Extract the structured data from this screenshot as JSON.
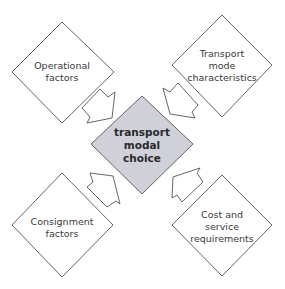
{
  "diagram": {
    "center": {
      "lines": [
        "transport",
        "modal",
        "choice"
      ],
      "fill": "#cfd0d8"
    },
    "nodes": [
      {
        "id": "operational",
        "lines": [
          "Operational",
          "factors"
        ],
        "position": "top-left"
      },
      {
        "id": "transport-mode",
        "lines": [
          "Transport",
          "mode",
          "characteristics"
        ],
        "position": "top-right"
      },
      {
        "id": "consignment",
        "lines": [
          "Consignment",
          "factors"
        ],
        "position": "bottom-left"
      },
      {
        "id": "cost-service",
        "lines": [
          "Cost and",
          "service",
          "requirements"
        ],
        "position": "bottom-right"
      }
    ],
    "arrows": [
      {
        "from": "operational",
        "to": "center"
      },
      {
        "from": "transport-mode",
        "to": "center"
      },
      {
        "from": "consignment",
        "to": "center"
      },
      {
        "from": "cost-service",
        "to": "center"
      }
    ],
    "colors": {
      "outline": "#555555",
      "node_fill": "#ffffff",
      "center_fill": "#cfd0d8",
      "text": "#3a3a3a"
    }
  }
}
